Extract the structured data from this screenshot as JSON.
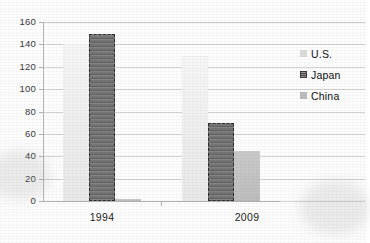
{
  "chart_data": {
    "type": "bar",
    "title": "",
    "subtitle": "",
    "xlabel": "",
    "ylabel": "",
    "categories": [
      "1994",
      "2009"
    ],
    "series": [
      {
        "name": "U.S.",
        "values": [
          140,
          130
        ],
        "color": "#f0f0f0"
      },
      {
        "name": "Japan",
        "values": [
          149,
          70
        ],
        "color": "#6e6e6e"
      },
      {
        "name": "China",
        "values": [
          2,
          45
        ],
        "color": "#c4c4c4"
      }
    ],
    "ylim": [
      0,
      160
    ],
    "ytick_step": 20,
    "yticks": [
      "160",
      "140",
      "120",
      "100",
      "80",
      "60",
      "40",
      "20",
      "0"
    ],
    "grid": true,
    "grid_orientation": "horizontal",
    "legend_position": "right",
    "legend_entries": [
      "U.S.",
      "Japan",
      "China"
    ]
  },
  "axes": {
    "y_tick_labels": [
      "160",
      "140",
      "120",
      "100",
      "80",
      "60",
      "40",
      "20",
      "0"
    ],
    "x_tick_labels": [
      "1994",
      "2009"
    ]
  },
  "legend": {
    "items": [
      {
        "label": "U.S.",
        "swatch": "legend-swatch-us"
      },
      {
        "label": "Japan",
        "swatch": "legend-swatch-japan"
      },
      {
        "label": "China",
        "swatch": "legend-swatch-china"
      }
    ]
  },
  "colors": {
    "us": "#f0f0f0",
    "japan": "#6e6e6e",
    "china": "#c4c4c4",
    "grid": "#d3d3d3",
    "axis": "#b0b0b0",
    "text": "#1d1d1d"
  }
}
